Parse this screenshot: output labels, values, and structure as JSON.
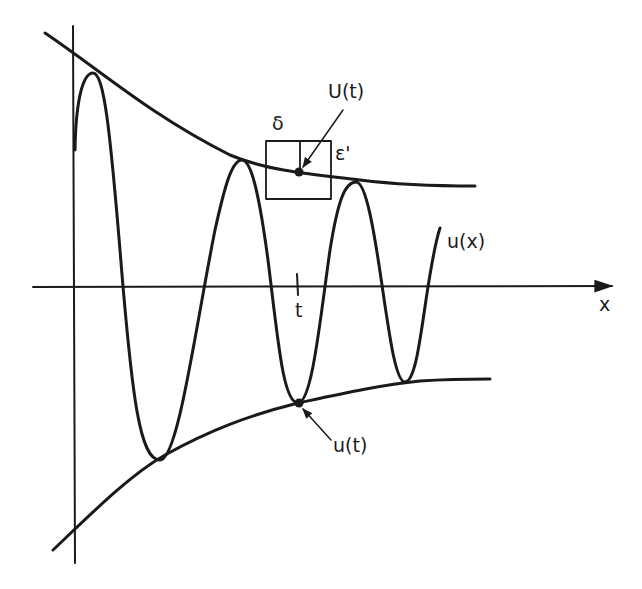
{
  "diagram": {
    "title": "",
    "axes": {
      "x_label": "x",
      "tick_label": "t"
    },
    "labels": {
      "upper_envelope_point": "U(t)",
      "lower_envelope_point": "u(t)",
      "function": "u(x)",
      "box_width": "δ",
      "box_height": "ε'"
    },
    "colors": {
      "ink": "#1a1a1a",
      "background": "#ffffff"
    }
  }
}
